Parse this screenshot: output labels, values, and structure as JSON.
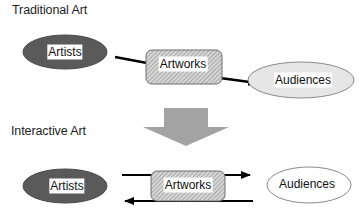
{
  "diagram": {
    "sections": {
      "traditional": {
        "title": "Traditional Art",
        "nodes": {
          "artists": "Artists",
          "artworks": "Artworks",
          "audiences": "Audiences"
        },
        "flow": [
          "Artists",
          "Artworks",
          "Audiences"
        ],
        "edges": [
          {
            "from": "Artists",
            "to": "Artworks",
            "style": "line"
          },
          {
            "from": "Artworks",
            "to": "Audiences",
            "style": "arrow"
          }
        ]
      },
      "interactive": {
        "title": "Interactive Art",
        "nodes": {
          "artists": "Artists",
          "artworks": "Artworks",
          "audiences": "Audiences"
        },
        "edges": [
          {
            "from": "Artists",
            "to": "Audiences",
            "via": "Artworks",
            "style": "arrow",
            "direction": "right"
          },
          {
            "from": "Audiences",
            "to": "Artists",
            "via": "Artworks",
            "style": "arrow",
            "direction": "left"
          }
        ]
      }
    },
    "transition": {
      "icon": "down-arrow-icon",
      "from": "Traditional Art",
      "to": "Interactive Art"
    },
    "colors": {
      "artists_fill": "#5a5a5a",
      "artworks_fill": "#c8c8c8",
      "audiences_fill": "#e6e6e6",
      "big_arrow_fill": "#a3a3a3",
      "line": "#000000"
    }
  }
}
